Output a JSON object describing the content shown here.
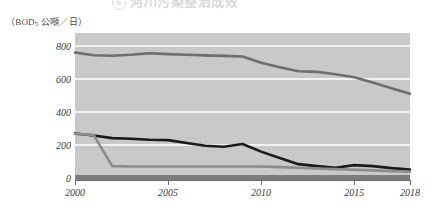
{
  "title": {
    "badge": "5",
    "text": "河川污染整治成效",
    "visible_state": "cropped-top"
  },
  "axis_unit_label": {
    "prefix": "（BOD",
    "sub": "5",
    "suffix": " 公噸／日）"
  },
  "chart_data": {
    "type": "line",
    "title": "河川污染整治成效",
    "xlabel": "",
    "ylabel": "（BOD5 公噸／日）",
    "xlim": [
      2000,
      2018
    ],
    "ylim": [
      0,
      880
    ],
    "grid": "horizontal",
    "legend": "none",
    "yticks": [
      800,
      600,
      400,
      200,
      0
    ],
    "ytick_labels": [
      "800",
      "600",
      "400",
      "200",
      "0"
    ],
    "xticks": [
      2000,
      2005,
      2010,
      2015,
      2018
    ],
    "xtick_labels": [
      "2000",
      "2005",
      "2010",
      "2015",
      "2018"
    ],
    "x": [
      2000,
      2001,
      2002,
      2003,
      2004,
      2005,
      2006,
      2007,
      2008,
      2009,
      2010,
      2011,
      2012,
      2013,
      2014,
      2015,
      2016,
      2017,
      2018
    ],
    "series": [
      {
        "name": "總污染量",
        "color": "#6e6e6e",
        "width": 2.6,
        "values": [
          762,
          745,
          742,
          748,
          757,
          752,
          748,
          744,
          741,
          737,
          700,
          672,
          648,
          644,
          630,
          612,
          580,
          545,
          512
        ]
      },
      {
        "name": "未處理污染量",
        "color": "#1a1a1a",
        "width": 2.6,
        "values": [
          270,
          258,
          242,
          238,
          232,
          230,
          212,
          196,
          190,
          206,
          160,
          122,
          84,
          72,
          62,
          78,
          72,
          60,
          52
        ]
      },
      {
        "name": "已處理污染量",
        "color": "#8c8c8c",
        "width": 2.6,
        "values": [
          268,
          262,
          72,
          70,
          70,
          70,
          70,
          70,
          70,
          70,
          70,
          66,
          62,
          58,
          54,
          50,
          46,
          42,
          38
        ]
      }
    ]
  }
}
